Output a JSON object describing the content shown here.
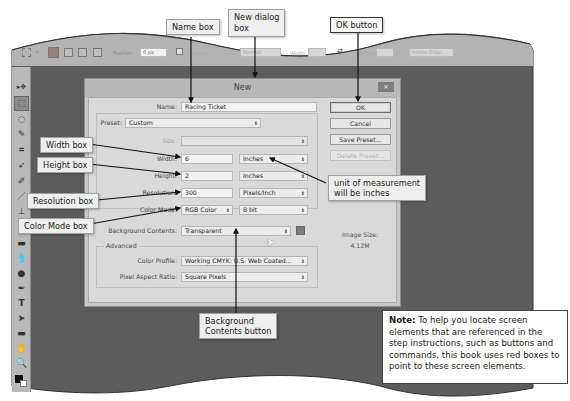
{
  "options_bar": {
    "feather_label": "Feather:",
    "feather_value": "0 px",
    "anti_alias_label": "Anti-alias",
    "style_label": "Style:",
    "style_value": "Normal",
    "width_label": "Width:",
    "height_label": "Height:",
    "refine_edge_label": "Refine Edge..."
  },
  "tools_panel": {
    "items": [
      "move",
      "rectangular-marquee",
      "lasso",
      "quick-selection",
      "crop",
      "eyedropper",
      "spot-healing-brush",
      "brush",
      "clone-stamp",
      "history-brush",
      "eraser",
      "gradient",
      "blur",
      "dodge",
      "pen",
      "type",
      "path-selection",
      "rectangle",
      "hand",
      "zoom"
    ]
  },
  "dialog": {
    "title": "New",
    "close_label": "×",
    "name_label": "Name:",
    "name_value": "Racing Ticket",
    "preset_label": "Preset:",
    "preset_value": "Custom",
    "size_label": "Size:",
    "size_value": "",
    "width_label": "Width:",
    "width_value": "6",
    "width_unit": "Inches",
    "height_label": "Height:",
    "height_value": "2",
    "height_unit": "Inches",
    "resolution_label": "Resolution:",
    "resolution_value": "300",
    "resolution_unit": "Pixels/Inch",
    "color_mode_label": "Color Mode:",
    "color_mode_value": "RGB Color",
    "bit_depth_value": "8 bit",
    "background_label": "Background Contents:",
    "background_value": "Transparent",
    "advanced_label": "Advanced",
    "color_profile_label": "Color Profile:",
    "color_profile_value": "Working CMYK: U.S. Web Coated...",
    "pixel_aspect_label": "Pixel Aspect Ratio:",
    "pixel_aspect_value": "Square Pixels",
    "buttons": {
      "ok": "OK",
      "cancel": "Cancel",
      "save_preset": "Save Preset...",
      "delete_preset": "Delete Preset..."
    },
    "image_size_label": "Image Size:",
    "image_size_value": "4.12M"
  },
  "callouts": {
    "name_box": "Name box",
    "new_dialog_box": "New dialog\nbox",
    "new_dialog_line1": "New dialog",
    "new_dialog_line2": "box",
    "ok_button": "OK button",
    "width_box": "Width box",
    "height_box": "Height box",
    "resolution_box": "Resolution box",
    "color_mode_box": "Color Mode box",
    "unit_line1": "unit of measurement",
    "unit_line2": "will be inches",
    "bg_line1": "Background",
    "bg_line2": "Contents button"
  },
  "note": {
    "heading": "Note:",
    "body": " To help you locate screen elements that are referenced in the step instructions, such as buttons and commands, this book uses red boxes to point to these screen elements."
  },
  "colors": {
    "workspace": "#5c5c5c",
    "dialog_bg": "#d9d9d9",
    "options_bar": "#b3b3b3"
  }
}
